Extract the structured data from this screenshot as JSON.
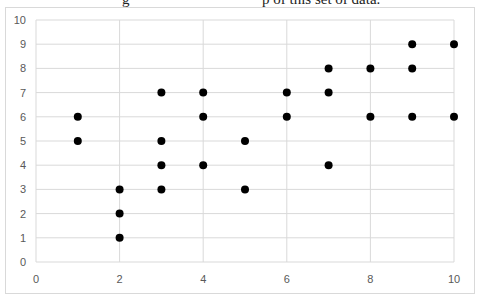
{
  "header": {
    "fragment_left": "g",
    "fragment_right": "p of this set of data."
  },
  "chart_data": {
    "type": "scatter",
    "title": "",
    "xlabel": "",
    "ylabel": "",
    "xlim": [
      0,
      10
    ],
    "ylim": [
      0,
      10
    ],
    "x_ticks": [
      0,
      2,
      4,
      6,
      8,
      10
    ],
    "y_ticks": [
      0,
      1,
      2,
      3,
      4,
      5,
      6,
      7,
      8,
      9,
      10
    ],
    "grid": true,
    "legend": null,
    "marker_color": "#000000",
    "series": [
      {
        "name": "data",
        "points": [
          [
            1,
            6
          ],
          [
            1,
            5
          ],
          [
            2,
            3
          ],
          [
            2,
            2
          ],
          [
            2,
            1
          ],
          [
            3,
            7
          ],
          [
            3,
            5
          ],
          [
            3,
            4
          ],
          [
            3,
            3
          ],
          [
            4,
            7
          ],
          [
            4,
            6
          ],
          [
            4,
            4
          ],
          [
            5,
            5
          ],
          [
            5,
            3
          ],
          [
            6,
            7
          ],
          [
            6,
            6
          ],
          [
            7,
            8
          ],
          [
            7,
            7
          ],
          [
            7,
            4
          ],
          [
            8,
            8
          ],
          [
            8,
            6
          ],
          [
            9,
            9
          ],
          [
            9,
            8
          ],
          [
            9,
            6
          ],
          [
            10,
            9
          ],
          [
            10,
            6
          ]
        ]
      }
    ]
  }
}
